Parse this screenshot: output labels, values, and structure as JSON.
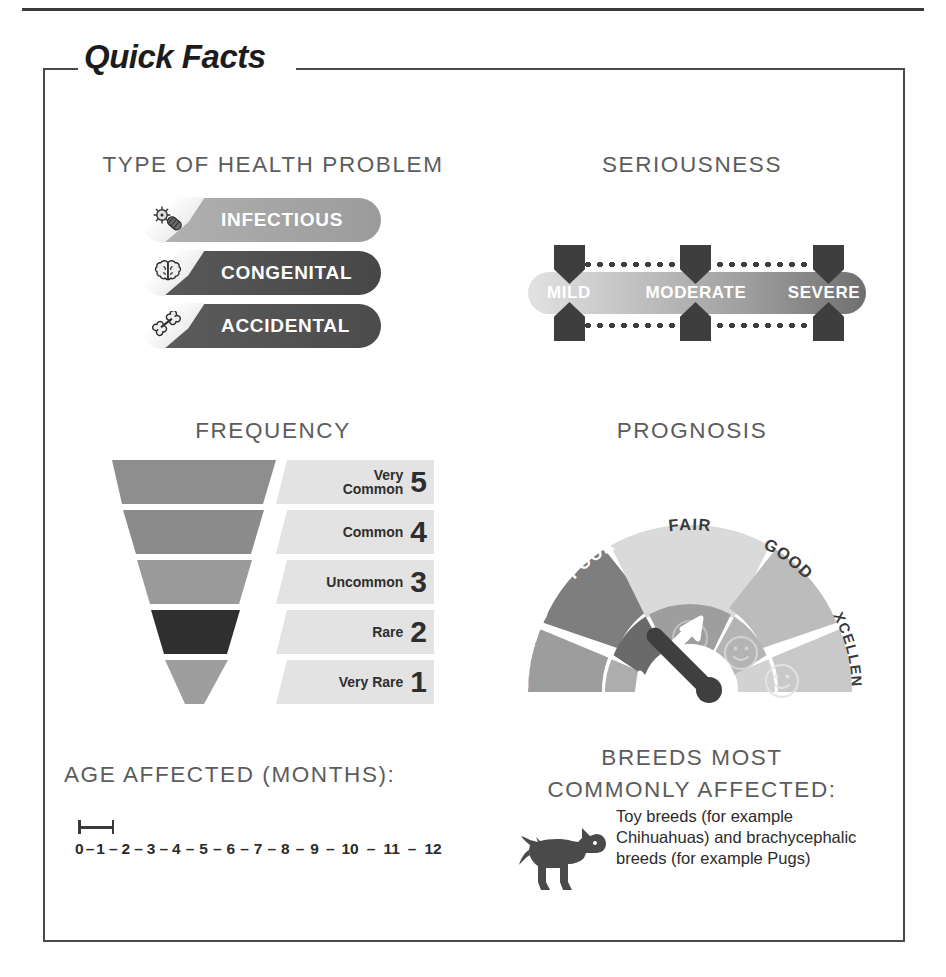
{
  "frame": {
    "title": "Quick Facts"
  },
  "sections": {
    "type_of_health_problem": {
      "heading": "TYPE OF HEALTH PROBLEM",
      "items": [
        {
          "label": "INFECTIOUS",
          "icon": "germ-icon",
          "color": "#a6a6a6",
          "selected": true
        },
        {
          "label": "CONGENITAL",
          "icon": "brain-icon",
          "color": "#4f4f4f",
          "selected": false
        },
        {
          "label": "ACCIDENTAL",
          "icon": "bone-icon",
          "color": "#545454",
          "selected": false
        }
      ]
    },
    "seriousness": {
      "heading": "SERIOUSNESS",
      "levels": [
        "MILD",
        "MODERATE",
        "SEVERE"
      ],
      "gradient_from": "#e2e2e2",
      "gradient_to": "#6f6f6f"
    },
    "frequency": {
      "heading": "FREQUENCY",
      "selected_value": 2,
      "rows": [
        {
          "label_line1": "Very",
          "label_line2": "Common",
          "value": "5",
          "fill": "#8e8e8e",
          "width_pct": 100,
          "highlight": false
        },
        {
          "label_line1": "",
          "label_line2": "Common",
          "value": "4",
          "fill": "#8b8b8b",
          "width_pct": 88,
          "highlight": false
        },
        {
          "label_line1": "",
          "label_line2": "Uncommon",
          "value": "3",
          "fill": "#9a9a9a",
          "width_pct": 72,
          "highlight": false
        },
        {
          "label_line1": "",
          "label_line2": "Rare",
          "value": "2",
          "fill": "#2f2f2f",
          "width_pct": 52,
          "highlight": true
        },
        {
          "label_line1": "",
          "label_line2": "Very Rare",
          "value": "1",
          "fill": "#9e9e9e",
          "width_pct": 32,
          "highlight": false
        }
      ]
    },
    "prognosis": {
      "heading": "PROGNOSIS",
      "segments": [
        {
          "label": "GUARDED",
          "outer": "#9d9d9d",
          "inner": "#adadad",
          "face": "none"
        },
        {
          "label": "POOR",
          "outer": "#7e7e7e",
          "inner": "#6a6a6a",
          "face": "none"
        },
        {
          "label": "FAIR",
          "outer": "#dadada",
          "inner": "#9e9e9e",
          "face": "neutral"
        },
        {
          "label": "GOOD",
          "outer": "#bcbcbc",
          "inner": "#b4b4b4",
          "face": "happy"
        },
        {
          "label": "EXCELLENT",
          "outer": "#c9c9c9",
          "inner": "#d2d2d2",
          "face": "happy"
        }
      ],
      "needle_points_to": "POOR",
      "needle_color": "#3f3f3f",
      "arrow_color": "#ffffff"
    },
    "age_affected": {
      "heading": "AGE AFFECTED (MONTHS):",
      "ticks": [
        "0",
        "1",
        "2",
        "3",
        "4",
        "5",
        "6",
        "7",
        "8",
        "9",
        "10",
        "11",
        "12"
      ],
      "separator": "–",
      "range_marker_from": "0",
      "range_marker_to": "1"
    },
    "breeds": {
      "heading_line1": "BREEDS MOST",
      "heading_line2": "COMMONLY AFFECTED:",
      "icon": "dog-icon",
      "text": "Toy breeds (for example Chihuahuas) and brachycephalic breeds (for example Pugs)"
    }
  }
}
